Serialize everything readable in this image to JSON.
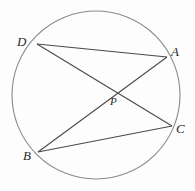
{
  "figure": {
    "kind": "circle-geometry-diagram",
    "background_color": "#fdfdfd",
    "stroke_color": "#4a4a4a",
    "label_color": "#2a2a2a",
    "width": 195,
    "height": 191
  },
  "circle": {
    "name": "circle",
    "cx": 96,
    "cy": 95,
    "r": 84,
    "stroke_color": "#8a8a8a",
    "stroke_width": 1.1
  },
  "points": [
    {
      "id": "D",
      "label": "D",
      "x": 37,
      "y": 44,
      "label_x": 17,
      "label_y": 35
    },
    {
      "id": "A",
      "label": "A",
      "x": 167,
      "y": 57,
      "label_x": 171,
      "label_y": 45
    },
    {
      "id": "C",
      "label": "C",
      "x": 172,
      "y": 126,
      "label_x": 176,
      "label_y": 122
    },
    {
      "id": "B",
      "label": "B",
      "x": 38,
      "y": 152,
      "label_x": 23,
      "label_y": 149
    },
    {
      "id": "P",
      "label": "P",
      "x": 111,
      "y": 89,
      "label_x": 110,
      "label_y": 96
    }
  ],
  "chords": [
    {
      "id": "DA",
      "from": "D",
      "to": "A",
      "label": "chord D to A",
      "x1": 37,
      "y1": 44,
      "x2": 167,
      "y2": 57
    },
    {
      "id": "DC",
      "from": "D",
      "to": "C",
      "label": "chord D to C",
      "x1": 37,
      "y1": 44,
      "x2": 172,
      "y2": 126
    },
    {
      "id": "AB",
      "from": "A",
      "to": "B",
      "label": "chord A to B",
      "x1": 167,
      "y1": 57,
      "x2": 38,
      "y2": 152
    },
    {
      "id": "BC",
      "from": "B",
      "to": "C",
      "label": "chord B to C",
      "x1": 38,
      "y1": 152,
      "x2": 172,
      "y2": 126
    }
  ],
  "intersection": {
    "id": "P",
    "label": "P",
    "x": 111,
    "y": 89,
    "of": [
      "DC",
      "AB"
    ]
  }
}
